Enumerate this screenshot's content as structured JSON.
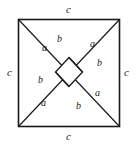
{
  "figure": {
    "type": "geometric-diagram",
    "stroke_color": "#1a1a1a",
    "background_color": "#ffffff",
    "outer_square": {
      "x": 18,
      "y": 19,
      "width": 102,
      "height": 108,
      "side_label": "c"
    },
    "side_labels": {
      "top": "c",
      "bottom": "c",
      "left": "c",
      "right": "c"
    },
    "segment_labels": [
      {
        "id": "a-top-left",
        "text": "a",
        "x": 44,
        "y": 47
      },
      {
        "id": "b-top-left",
        "text": "b",
        "x": 59,
        "y": 40
      },
      {
        "id": "a-top-right",
        "text": "a",
        "x": 93,
        "y": 44
      },
      {
        "id": "b-top-right",
        "text": "b",
        "x": 99,
        "y": 63
      },
      {
        "id": "b-bottom-left",
        "text": "b",
        "x": 40,
        "y": 80
      },
      {
        "id": "a-bottom-left",
        "text": "a",
        "x": 42,
        "y": 102
      },
      {
        "id": "b-bottom-right",
        "text": "b",
        "x": 78,
        "y": 105
      },
      {
        "id": "a-bottom-right",
        "text": "a",
        "x": 97,
        "y": 93
      }
    ],
    "lines": [
      {
        "id": "diag-tl-br",
        "x1": 18,
        "y1": 19,
        "x2": 120,
        "y2": 127
      },
      {
        "id": "diag-bl-tr",
        "x1": 18,
        "y1": 127,
        "x2": 120,
        "y2": 19
      },
      {
        "id": "inner-seg-top",
        "x1": 69,
        "y1": 58,
        "x2": 82,
        "y2": 72
      },
      {
        "id": "inner-seg-left",
        "x1": 56,
        "y1": 72,
        "x2": 69,
        "y2": 86
      },
      {
        "id": "inner-seg-bottom",
        "x1": 56,
        "y1": 72,
        "x2": 69,
        "y2": 58
      },
      {
        "id": "inner-seg-right",
        "x1": 69,
        "y1": 86,
        "x2": 82,
        "y2": 72
      }
    ],
    "inner_square": {
      "points": "69,58 82,72 69,86 56,72"
    }
  }
}
